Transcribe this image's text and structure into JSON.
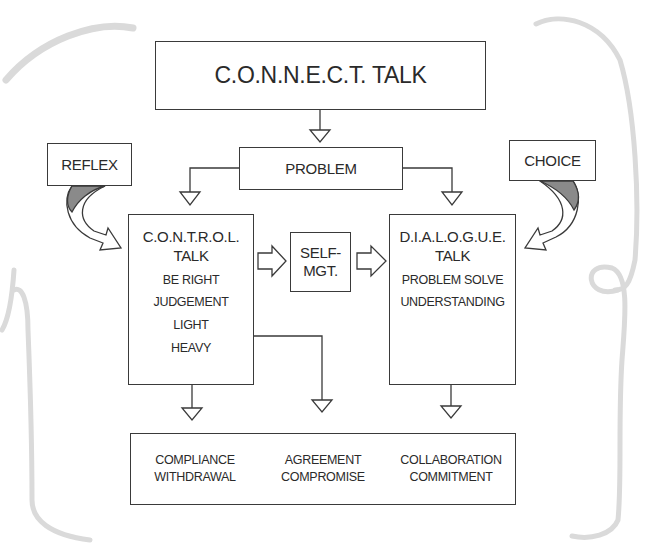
{
  "diagram": {
    "title": "C.O.N.N.E.C.T. TALK",
    "problem": "PROBLEM",
    "reflex": "REFLEX",
    "choice": "CHOICE",
    "control": {
      "heading_line1": "C.O.N.T.R.O.L.",
      "heading_line2": "TALK",
      "items": [
        "BE RIGHT",
        "JUDGEMENT",
        "LIGHT",
        "HEAVY"
      ]
    },
    "self_management": {
      "line1": "SELF-",
      "line2": "MGT."
    },
    "dialogue": {
      "heading_line1": "D.I.A.L.O.G.U.E.",
      "heading_line2": "TALK",
      "items": [
        "PROBLEM SOLVE",
        "UNDERSTANDING"
      ]
    },
    "outcomes": [
      {
        "line1": "COMPLIANCE",
        "line2": "WITHDRAWAL"
      },
      {
        "line1": "AGREEMENT",
        "line2": "COMPROMISE"
      },
      {
        "line1": "COLLABORATION",
        "line2": "COMMITMENT"
      }
    ],
    "colors": {
      "stroke": "#3a3a3a",
      "arrow_shading": "#8a8a8a",
      "decorative_swirl": "#d9d9d9"
    }
  }
}
